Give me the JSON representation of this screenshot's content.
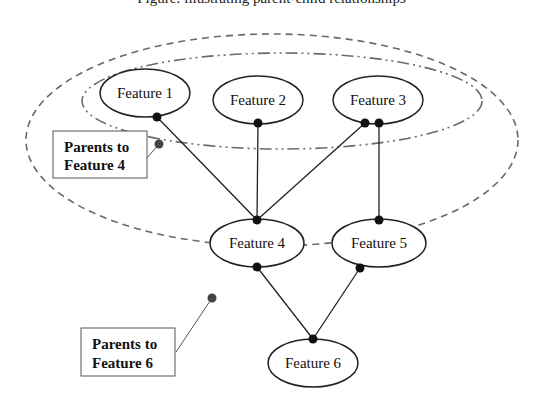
{
  "caption": {
    "text": "Figure: illustrating parent-child relationships"
  },
  "diagram": {
    "nodes": [
      {
        "id": "f1",
        "label": "Feature 1"
      },
      {
        "id": "f2",
        "label": "Feature 2"
      },
      {
        "id": "f3",
        "label": "Feature 3"
      },
      {
        "id": "f4",
        "label": "Feature 4"
      },
      {
        "id": "f5",
        "label": "Feature 5"
      },
      {
        "id": "f6",
        "label": "Feature 6"
      }
    ],
    "edges": [
      {
        "from": "f1",
        "to": "f4"
      },
      {
        "from": "f2",
        "to": "f4"
      },
      {
        "from": "f3",
        "to": "f4"
      },
      {
        "from": "f3",
        "to": "f5"
      },
      {
        "from": "f4",
        "to": "f6"
      },
      {
        "from": "f5",
        "to": "f6"
      }
    ],
    "groups": [
      {
        "id": "parents-f4",
        "members": [
          "f1",
          "f2",
          "f3"
        ],
        "style": "dash-dot",
        "annotation": {
          "line1": "Parents to",
          "line2": "Feature 4"
        }
      },
      {
        "id": "parents-f6",
        "members": [
          "f1",
          "f2",
          "f3",
          "f4",
          "f5"
        ],
        "style": "dashed",
        "annotation": {
          "line1": "Parents to",
          "line2": "Feature 6"
        }
      }
    ],
    "colors": {
      "node_stroke": "#222222",
      "group_stroke": "#666666",
      "dot": "#111111",
      "box_stroke": "#555555"
    }
  }
}
